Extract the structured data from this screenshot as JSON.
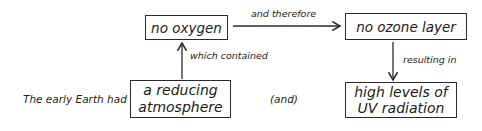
{
  "diagram": {
    "nodes": {
      "no_oxygen": "no oxygen",
      "no_ozone": "no ozone layer",
      "reducing_atmosphere": "a reducing atmosphere",
      "high_uv": "high levels of UV radiation"
    },
    "reducing_lines": [
      "a reducing",
      "atmosphere"
    ],
    "uv_lines": [
      "high levels of",
      "UV radiation"
    ],
    "edges": {
      "which_contained": "which contained",
      "and_therefore": "and therefore",
      "resulting_in": "resulting in"
    },
    "side_text": {
      "intro": "The early Earth had",
      "conjunction": "(and)"
    }
  }
}
